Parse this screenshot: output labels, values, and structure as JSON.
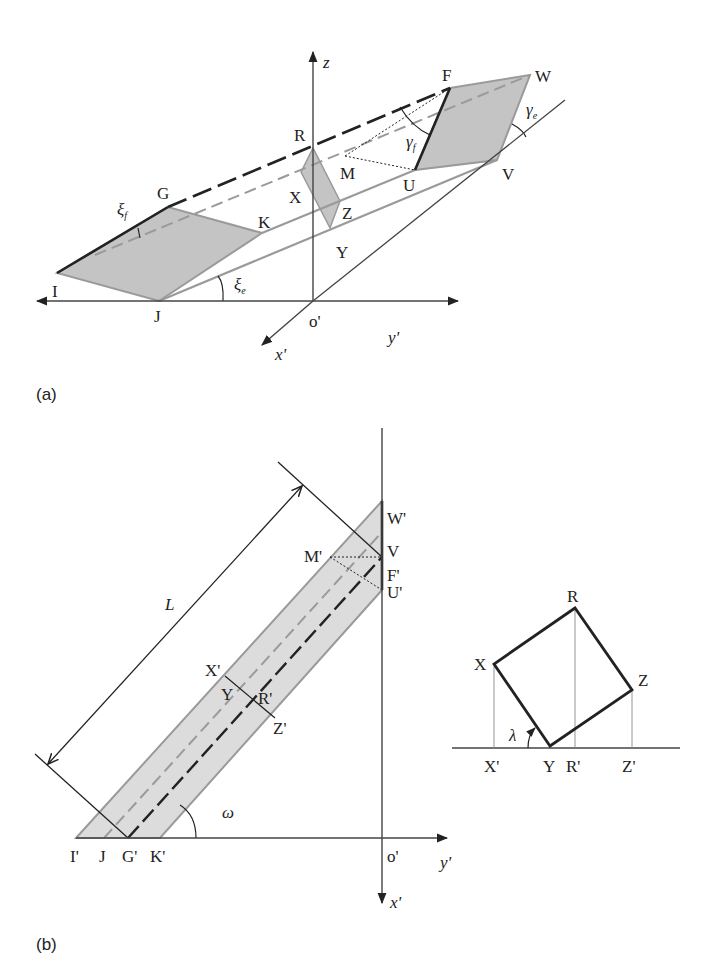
{
  "panel_a": {
    "caption": "(a)",
    "axes": {
      "z": "z",
      "y": "y'",
      "x": "x'",
      "origin": "o'"
    },
    "points": {
      "F": "F",
      "W": "W",
      "R": "R",
      "G": "G",
      "M": "M",
      "U": "U",
      "V": "V",
      "X": "X",
      "Z": "Z",
      "K": "K",
      "Y": "Y",
      "I": "I",
      "J": "J"
    },
    "angles": {
      "xi_f": "ξ",
      "xi_f_sub": "f",
      "xi_e": "ξ",
      "xi_e_sub": "e",
      "gamma_f": "γ",
      "gamma_f_sub": "f",
      "gamma_e": "γ",
      "gamma_e_sub": "e"
    }
  },
  "panel_b": {
    "caption": "(b)",
    "axes": {
      "y": "y'",
      "x": "x'",
      "origin": "o'"
    },
    "dimension": "L",
    "angle": "ω",
    "points": {
      "W": "W'",
      "V": "V",
      "M": "M'",
      "F": "F'",
      "U": "U'",
      "X": "X'",
      "Y": "Y",
      "R": "R'",
      "Z": "Z'",
      "I": "I'",
      "J": "J",
      "G": "G'",
      "K": "K'"
    }
  },
  "cross_section": {
    "points": {
      "R": "R",
      "X": "X",
      "Z": "Z",
      "Y": "Y"
    },
    "projections": {
      "X": "X'",
      "Y": "Y",
      "R": "R'",
      "Z": "Z'"
    },
    "angle": "λ"
  },
  "colors": {
    "ink": "#222222",
    "gray_line": "#9a9a9a",
    "fill": "#c4c4c4",
    "band_fill": "#dcdcdc"
  }
}
